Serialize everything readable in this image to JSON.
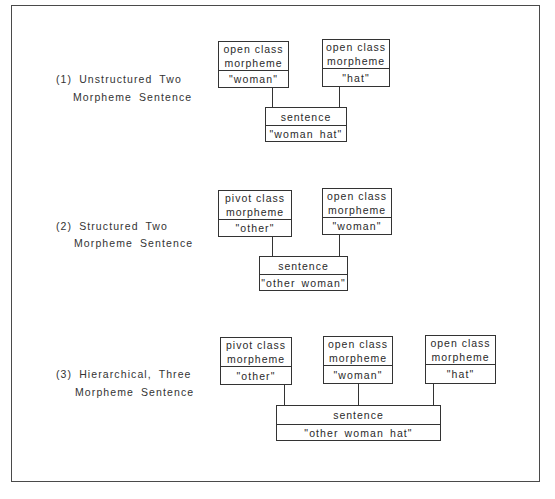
{
  "diagrams": [
    {
      "label_line1": "(1) Unstructured  Two",
      "label_line2": "Morpheme Sentence",
      "morphemes": [
        {
          "class_line1": "open class",
          "class_line2": "morpheme",
          "value": "\"woman\""
        },
        {
          "class_line1": "open class",
          "class_line2": "morpheme",
          "value": "\"hat\""
        }
      ],
      "sentence": {
        "label": "sentence",
        "value": "\"woman hat\""
      }
    },
    {
      "label_line1": "(2)  Structured Two",
      "label_line2": "Morpheme Sentence",
      "morphemes": [
        {
          "class_line1": "pivot class",
          "class_line2": "morpheme",
          "value": "\"other\""
        },
        {
          "class_line1": "open class",
          "class_line2": "morpheme",
          "value": "\"woman\""
        }
      ],
      "sentence": {
        "label": "sentence",
        "value": "\"other woman\""
      }
    },
    {
      "label_line1": "(3) Hierarchical, Three",
      "label_line2": "Morpheme Sentence",
      "morphemes": [
        {
          "class_line1": "pivot class",
          "class_line2": "morpheme",
          "value": "\"other\""
        },
        {
          "class_line1": "open class",
          "class_line2": "morpheme",
          "value": "\"woman\""
        },
        {
          "class_line1": "open class",
          "class_line2": "morpheme",
          "value": "\"hat\""
        }
      ],
      "sentence": {
        "label": "sentence",
        "value": "\"other woman hat\""
      }
    }
  ]
}
